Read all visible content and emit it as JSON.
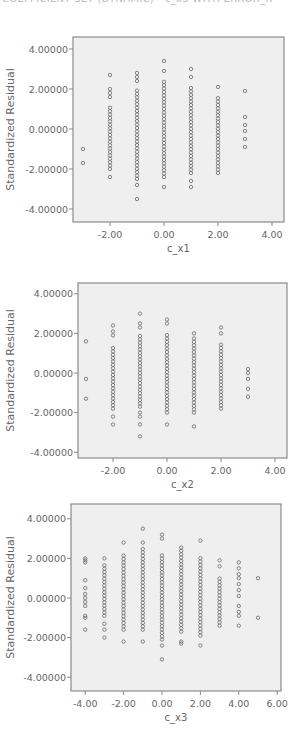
{
  "header": {
    "text": "COEFFICIENT SET (DYNAMIC) - c_x3 WITH ERROR_R"
  },
  "colors": {
    "plot_bg": "#efefef",
    "axis": "#8a8a8a",
    "marker": "#6a6a6a",
    "text": "#666666"
  },
  "chart_data": [
    {
      "type": "scatter",
      "title": "",
      "xlabel": "c_x1",
      "ylabel": "Standardized Residual",
      "xticks": [
        "-2.00",
        "0.00",
        "2.00",
        "4.00"
      ],
      "yticks": [
        "4.00000",
        "2.00000",
        "0.00000",
        "-2.00000",
        "-4.00000"
      ],
      "xlim": [
        -3.4,
        4.4
      ],
      "ylim": [
        -4.6,
        4.6
      ],
      "grid": false,
      "columns": [
        {
          "x": -3.0,
          "y": [
            -1.0,
            -1.7
          ]
        },
        {
          "x": -2.0,
          "y_min": -2.0,
          "y_max": 1.1,
          "outliers": [
            2.7,
            2.0,
            1.8,
            1.6,
            -2.4
          ]
        },
        {
          "x": -1.0,
          "y_min": -2.5,
          "y_max": 2.0,
          "outliers": [
            2.8,
            2.6,
            2.4,
            -2.8,
            -3.5
          ]
        },
        {
          "x": 0.0,
          "y_min": -2.4,
          "y_max": 2.5,
          "outliers": [
            3.4,
            2.9,
            -2.9
          ]
        },
        {
          "x": 1.0,
          "y_min": -2.2,
          "y_max": 2.2,
          "outliers": [
            3.0,
            2.6,
            -2.6,
            -2.9
          ]
        },
        {
          "x": 2.0,
          "y_min": -2.2,
          "y_max": 1.7,
          "outliers": [
            2.1
          ]
        },
        {
          "x": 3.0,
          "y": [
            1.9,
            0.6,
            0.2,
            -0.1,
            -0.5,
            -0.9
          ]
        }
      ]
    },
    {
      "type": "scatter",
      "title": "",
      "xlabel": "c_x2",
      "ylabel": "Standardized Residual",
      "xticks": [
        "-2.00",
        "0.00",
        "2.00",
        "4.00"
      ],
      "yticks": [
        "4.00000",
        "2.00000",
        "0.00000",
        "-2.00000",
        "-4.00000"
      ],
      "xlim": [
        -3.4,
        4.4
      ],
      "ylim": [
        -4.6,
        4.6
      ],
      "grid": false,
      "columns": [
        {
          "x": -3.0,
          "y": [
            1.6,
            -0.3,
            -1.3
          ]
        },
        {
          "x": -2.0,
          "y_min": -1.8,
          "y_max": 1.3,
          "outliers": [
            2.4,
            2.1,
            1.9,
            -2.2,
            -2.6
          ]
        },
        {
          "x": -1.0,
          "y_min": -1.7,
          "y_max": 2.0,
          "outliers": [
            3.0,
            2.5,
            2.3,
            -2.0,
            -2.2,
            -2.6,
            -3.2
          ]
        },
        {
          "x": 0.0,
          "y_min": -2.0,
          "y_max": 2.0,
          "outliers": [
            2.7,
            2.5,
            -2.6
          ]
        },
        {
          "x": 1.0,
          "y_min": -2.0,
          "y_max": 1.8,
          "outliers": [
            2.0,
            -2.7
          ]
        },
        {
          "x": 2.0,
          "y_min": -1.8,
          "y_max": 1.5,
          "outliers": [
            2.3,
            2.0
          ]
        },
        {
          "x": 3.0,
          "y": [
            0.2,
            0.0,
            -0.3,
            -0.8,
            -1.2
          ]
        }
      ]
    },
    {
      "type": "scatter",
      "title": "",
      "xlabel": "c_x3",
      "ylabel": "Standardized Residual",
      "xticks": [
        "-4.00",
        "-2.00",
        "0.00",
        "2.00",
        "4.00",
        "6.00"
      ],
      "yticks": [
        "4.00000",
        "2.00000",
        "0.00000",
        "-2.00000",
        "-4.00000"
      ],
      "xlim": [
        -4.7,
        6.2
      ],
      "ylim": [
        -4.7,
        4.7
      ],
      "grid": false,
      "columns": [
        {
          "x": -4.0,
          "y": [
            2.0,
            1.9,
            1.8,
            0.9,
            0.5,
            0.2,
            0.0,
            -0.2,
            -0.4,
            -0.9,
            -1.0,
            -1.6
          ]
        },
        {
          "x": -3.0,
          "y_min": -0.9,
          "y_max": 1.7,
          "outliers": [
            2.0,
            -1.3,
            -1.6,
            -2.0
          ]
        },
        {
          "x": -2.0,
          "y_min": -1.6,
          "y_max": 2.3,
          "outliers": [
            2.8,
            -2.2
          ]
        },
        {
          "x": -1.0,
          "y_min": -1.6,
          "y_max": 2.5,
          "outliers": [
            3.5,
            2.8,
            -2.2
          ]
        },
        {
          "x": 0.0,
          "y_min": -2.1,
          "y_max": 2.3,
          "outliers": [
            3.2,
            3.0,
            -2.4,
            -3.1
          ]
        },
        {
          "x": 1.0,
          "y_min": -1.7,
          "y_max": 2.7,
          "outliers": [
            -2.2,
            -2.3
          ]
        },
        {
          "x": 2.0,
          "y_min": -1.9,
          "y_max": 2.1,
          "outliers": [
            2.9,
            -2.4
          ]
        },
        {
          "x": 3.0,
          "y_min": -1.4,
          "y_max": 1.1,
          "outliers": [
            1.9,
            1.6
          ]
        },
        {
          "x": 4.0,
          "y": [
            1.8,
            1.5,
            1.2,
            1.0,
            0.7,
            0.4,
            0.1,
            -0.4,
            -0.7,
            -0.9,
            -1.4
          ]
        },
        {
          "x": 5.0,
          "y": [
            1.0,
            -1.0
          ]
        }
      ]
    }
  ],
  "layout": [
    {
      "top": 37,
      "box": {
        "left": 73,
        "right": 284,
        "top": 37,
        "bottom": 222
      },
      "xmap": {
        "v0": 0,
        "p0": 164,
        "ppu": 27
      },
      "ymap": {
        "v0": 0,
        "p0": 129,
        "ppu": 20
      },
      "xtick_vals": [
        -2,
        0,
        2,
        4
      ],
      "ytick_vals": [
        4,
        2,
        0,
        -2,
        -4
      ],
      "xlabel_y": 252
    },
    {
      "top": 283,
      "box": {
        "left": 78,
        "right": 287,
        "top": 283,
        "bottom": 458
      },
      "xmap": {
        "v0": 0,
        "p0": 167,
        "ppu": 27
      },
      "ymap": {
        "v0": 0,
        "p0": 373,
        "ppu": 19.8
      },
      "xtick_vals": [
        -2,
        0,
        2,
        4
      ],
      "ytick_vals": [
        4,
        2,
        0,
        -2,
        -4
      ],
      "xlabel_y": 488
    },
    {
      "top": 504,
      "box": {
        "left": 71,
        "right": 281,
        "top": 504,
        "bottom": 691
      },
      "xmap": {
        "v0": 0,
        "p0": 162,
        "ppu": 19.2
      },
      "ymap": {
        "v0": 0,
        "p0": 598,
        "ppu": 19.8
      },
      "xtick_vals": [
        -4,
        -2,
        0,
        2,
        4,
        6
      ],
      "ytick_vals": [
        4,
        2,
        0,
        -2,
        -4
      ],
      "xlabel_y": 721
    }
  ]
}
